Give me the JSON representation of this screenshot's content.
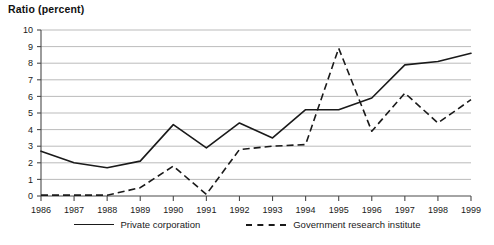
{
  "chart_data": {
    "type": "line",
    "title": "Ratio (percent)",
    "xlabel": "",
    "ylabel": "Ratio (percent)",
    "ylim": [
      0,
      10
    ],
    "ytick_step": 1,
    "grid": true,
    "legend_position": "bottom",
    "categories": [
      "1986",
      "1987",
      "1988",
      "1989",
      "1990",
      "1991",
      "1992",
      "1993",
      "1994",
      "1995",
      "1996",
      "1997",
      "1998",
      "1999"
    ],
    "yticks": [
      "0",
      "1",
      "2",
      "3",
      "4",
      "5",
      "6",
      "7",
      "8",
      "9",
      "10"
    ],
    "series": [
      {
        "name": "Private corporation",
        "style": "solid",
        "values": [
          2.7,
          2.0,
          1.7,
          2.1,
          4.3,
          2.9,
          4.4,
          3.5,
          5.2,
          5.2,
          5.9,
          7.9,
          8.1,
          8.6
        ]
      },
      {
        "name": "Government research institute",
        "style": "dashed",
        "values": [
          0.05,
          0.05,
          0.05,
          0.5,
          1.8,
          0.1,
          2.8,
          3.0,
          3.1,
          8.9,
          3.9,
          6.2,
          4.4,
          5.8
        ]
      }
    ]
  },
  "legend": {
    "entries": [
      {
        "label": "Private corporation"
      },
      {
        "label": "Government research institute"
      }
    ]
  }
}
